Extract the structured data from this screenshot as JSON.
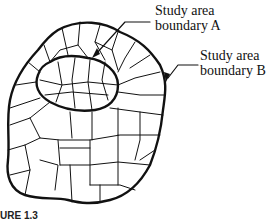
{
  "labels": {
    "boundary_a": [
      "Study area",
      "boundary A"
    ],
    "boundary_b": [
      "Study area",
      "boundary B"
    ]
  },
  "caption": "URE 1.3",
  "colors": {
    "line": "#111111",
    "background": "#ffffff"
  }
}
